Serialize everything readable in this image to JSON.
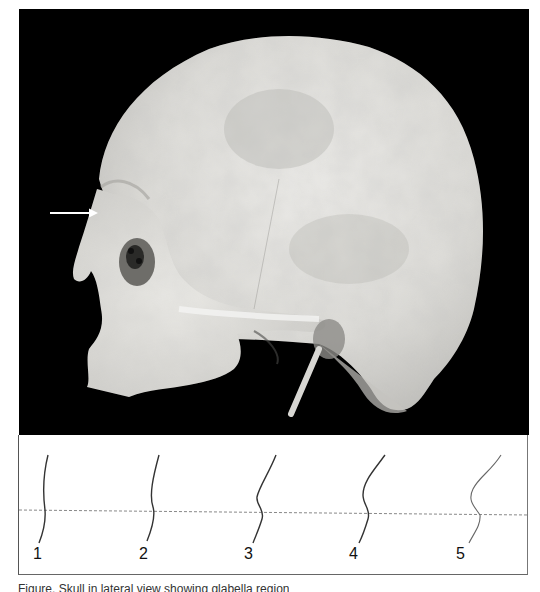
{
  "figure": {
    "photo": {
      "subject": "human skull, left lateral view",
      "background_color": "#000000",
      "bone_color": "#e6e6e2",
      "arrow": {
        "label": "arrow-pointing-to-brow-ridge",
        "color": "#ffffff"
      }
    },
    "profiles": {
      "description": "brow ridge profile outlines graded 1 to 5",
      "reference_line": "dashed horizontal",
      "labels": [
        "1",
        "2",
        "3",
        "4",
        "5"
      ]
    },
    "caption": {
      "text": "Figure. Skull in lateral view showing glabella region"
    }
  }
}
